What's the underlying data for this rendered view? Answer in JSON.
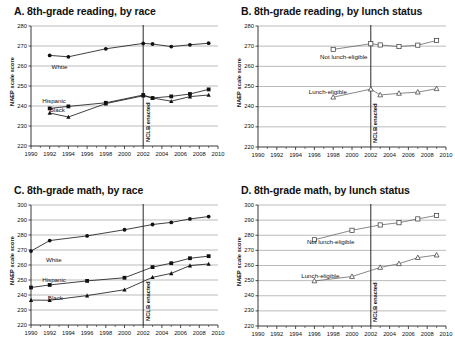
{
  "figure": {
    "y_axis_label": "NAEP scale score",
    "reference_line_label": "NCLB enacted",
    "reference_line_year": 2002,
    "x_ticks": [
      "1990",
      "1992",
      "1994",
      "1996",
      "1998",
      "2000",
      "2002",
      "2004",
      "2006",
      "2008",
      "2010"
    ],
    "xlim": [
      1990,
      2010
    ]
  },
  "chart_data": [
    {
      "type": "line",
      "panel": "A",
      "title": "A. 8th-grade reading, by race",
      "xlabel": "",
      "ylabel": "NAEP scale score",
      "ylim": [
        220,
        280
      ],
      "yticks": [
        220,
        230,
        240,
        250,
        260,
        270,
        280
      ],
      "xlim": [
        1990,
        2010
      ],
      "grid": "horizontal",
      "legend": "inline-labels",
      "annotations": [
        {
          "text": "NCLB enacted",
          "x": 2002,
          "orientation": "vertical"
        }
      ],
      "series": [
        {
          "name": "White",
          "marker": "filled-circle",
          "x": [
            1992,
            1994,
            1998,
            2002,
            2003,
            2005,
            2007,
            2009
          ],
          "y": [
            265.3,
            264.6,
            268.6,
            271.3,
            271.0,
            269.7,
            270.6,
            271.4
          ]
        },
        {
          "name": "Hispanic",
          "marker": "filled-square",
          "x": [
            1992,
            1994,
            1998,
            2002,
            2003,
            2005,
            2007,
            2009
          ],
          "y": [
            238.8,
            239.8,
            241.6,
            245.5,
            244.0,
            244.8,
            246.0,
            248.3
          ]
        },
        {
          "name": "Black",
          "marker": "filled-triangle",
          "x": [
            1992,
            1994,
            1998,
            2002,
            2003,
            2005,
            2007,
            2009
          ],
          "y": [
            236.5,
            234.5,
            241.2,
            245.1,
            244.0,
            242.4,
            244.7,
            245.5
          ]
        }
      ]
    },
    {
      "type": "line",
      "panel": "B",
      "title": "B. 8th-grade reading, by lunch status",
      "xlabel": "",
      "ylabel": "NAEP scale score",
      "ylim": [
        220,
        280
      ],
      "yticks": [
        220,
        230,
        240,
        250,
        260,
        270,
        280
      ],
      "xlim": [
        1990,
        2010
      ],
      "grid": "horizontal",
      "legend": "inline-labels",
      "annotations": [
        {
          "text": "NCLB enacted",
          "x": 2002,
          "orientation": "vertical"
        }
      ],
      "series": [
        {
          "name": "Not lunch-eligible",
          "marker": "open-square",
          "x": [
            1998,
            2002,
            2003,
            2005,
            2007,
            2009
          ],
          "y": [
            268.4,
            271.2,
            270.6,
            269.8,
            270.5,
            272.8
          ]
        },
        {
          "name": "Lunch-eligible",
          "marker": "open-triangle",
          "x": [
            1998,
            2002,
            2003,
            2005,
            2007,
            2009
          ],
          "y": [
            244.7,
            248.7,
            245.8,
            246.6,
            247.2,
            248.9
          ]
        }
      ]
    },
    {
      "type": "line",
      "panel": "C",
      "title": "C. 8th-grade math, by race",
      "xlabel": "",
      "ylabel": "NAEP scale score",
      "ylim": [
        220,
        300
      ],
      "yticks": [
        220,
        230,
        240,
        250,
        260,
        270,
        280,
        290,
        300
      ],
      "xlim": [
        1990,
        2010
      ],
      "grid": "horizontal",
      "legend": "inline-labels",
      "annotations": [
        {
          "text": "NCLB enacted",
          "x": 2002,
          "orientation": "vertical"
        }
      ],
      "series": [
        {
          "name": "White",
          "marker": "filled-circle",
          "x": [
            1990,
            1992,
            1996,
            2000,
            2003,
            2005,
            2007,
            2009
          ],
          "y": [
            269.3,
            276.3,
            279.4,
            283.5,
            287.0,
            288.4,
            290.7,
            292.3
          ]
        },
        {
          "name": "Hispanic",
          "marker": "filled-square",
          "x": [
            1990,
            1992,
            1996,
            2000,
            2003,
            2005,
            2007,
            2009
          ],
          "y": [
            245.0,
            246.7,
            249.4,
            251.5,
            258.6,
            261.2,
            264.5,
            265.9
          ]
        },
        {
          "name": "Black",
          "marker": "filled-triangle",
          "x": [
            1990,
            1992,
            1996,
            2000,
            2003,
            2005,
            2007,
            2009
          ],
          "y": [
            236.6,
            236.5,
            239.6,
            243.5,
            251.8,
            254.4,
            259.6,
            260.7
          ]
        }
      ]
    },
    {
      "type": "line",
      "panel": "D",
      "title": "D. 8th-grade math, by lunch status",
      "xlabel": "",
      "ylabel": "NAEP scale score",
      "ylim": [
        220,
        300
      ],
      "yticks": [
        220,
        230,
        240,
        250,
        260,
        270,
        280,
        290,
        300
      ],
      "xlim": [
        1990,
        2010
      ],
      "grid": "horizontal",
      "legend": "inline-labels",
      "annotations": [
        {
          "text": "NCLB enacted",
          "x": 2002,
          "orientation": "vertical"
        }
      ],
      "series": [
        {
          "name": "Not lunch-eligible",
          "marker": "open-square",
          "x": [
            1996,
            2000,
            2003,
            2005,
            2007,
            2009
          ],
          "y": [
            277.0,
            283.3,
            286.8,
            288.3,
            290.8,
            293.1
          ]
        },
        {
          "name": "Lunch-eligible",
          "marker": "open-triangle",
          "x": [
            1996,
            2000,
            2003,
            2005,
            2007,
            2009
          ],
          "y": [
            249.8,
            252.7,
            258.7,
            261.2,
            265.2,
            266.9
          ]
        }
      ]
    }
  ]
}
